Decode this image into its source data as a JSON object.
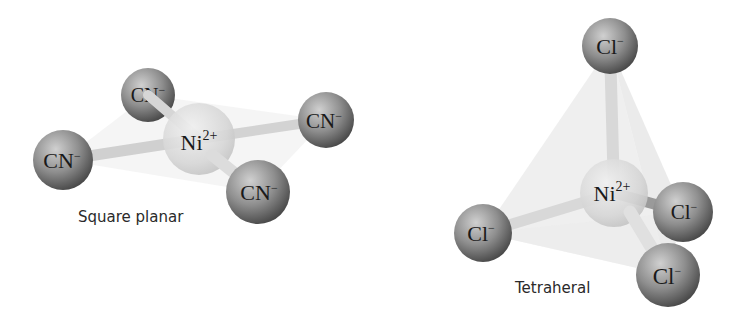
{
  "figure": {
    "colors": {
      "ligand": "#8c8c8c",
      "ligand_dark": "#4a4a4a",
      "ligand_light": "#d8d8d8",
      "metal": "#d4d4d4",
      "metal_light": "#ececec",
      "bond": "#d6d6d6",
      "face": "#e6e6e6",
      "text": "#1a1a1a"
    },
    "square_planar": {
      "caption": "Square planar",
      "metal": {
        "symbol": "Ni",
        "charge": "2+",
        "cx": 199,
        "cy": 139,
        "r": 36
      },
      "ligands": [
        {
          "symbol": "CN",
          "charge": "−",
          "cx": 148,
          "cy": 95,
          "r": 27,
          "position": "top-back"
        },
        {
          "symbol": "CN",
          "charge": "−",
          "cx": 326,
          "cy": 120,
          "r": 28,
          "position": "right"
        },
        {
          "symbol": "CN",
          "charge": "−",
          "cx": 63,
          "cy": 160,
          "r": 30,
          "position": "left"
        },
        {
          "symbol": "CN",
          "charge": "−",
          "cx": 258,
          "cy": 192,
          "r": 32,
          "position": "bottom-front"
        }
      ]
    },
    "tetrahedral": {
      "caption": "Tetraheral",
      "metal": {
        "symbol": "Ni",
        "charge": "2+",
        "cx": 614,
        "cy": 193,
        "r": 34
      },
      "ligands": [
        {
          "symbol": "Cl",
          "charge": "−",
          "cx": 610,
          "cy": 46,
          "r": 28,
          "position": "top"
        },
        {
          "symbol": "Cl",
          "charge": "−",
          "cx": 683,
          "cy": 212,
          "r": 30,
          "position": "right-back"
        },
        {
          "symbol": "Cl",
          "charge": "−",
          "cx": 483,
          "cy": 233,
          "r": 29,
          "position": "left"
        },
        {
          "symbol": "Cl",
          "charge": "−",
          "cx": 668,
          "cy": 275,
          "r": 32,
          "position": "bottom-front"
        }
      ]
    }
  }
}
